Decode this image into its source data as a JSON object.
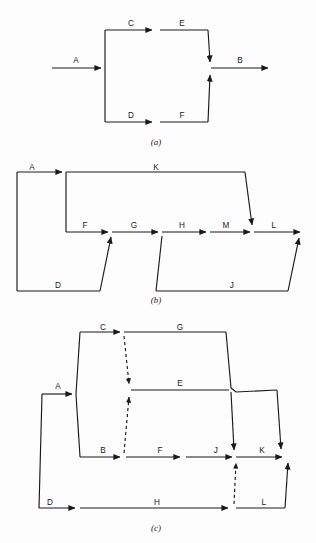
{
  "figure": {
    "background_color": "#fdfdfd",
    "line_color": "#1a1a1a",
    "width": 316,
    "height": 543
  },
  "diagrams": [
    {
      "id": "a",
      "caption": "(a)",
      "caption_x": 156,
      "caption_y": 145,
      "description": "Simple parallel network: activity A splits into parallel paths C-E and D-F which merge into B",
      "activities": [
        {
          "label": "A",
          "x": 76,
          "y": 63
        },
        {
          "label": "C",
          "x": 131,
          "y": 26
        },
        {
          "label": "E",
          "x": 182,
          "y": 26
        },
        {
          "label": "D",
          "x": 131,
          "y": 118
        },
        {
          "label": "F",
          "x": 182,
          "y": 118
        },
        {
          "label": "B",
          "x": 240,
          "y": 63
        }
      ]
    },
    {
      "id": "b",
      "caption": "(b)",
      "caption_x": 156,
      "caption_y": 303,
      "description": "Network with long bypass activity K over chain F-G-H-M, plus feeder activities D and J merging in",
      "activities": [
        {
          "label": "A",
          "x": 32,
          "y": 170
        },
        {
          "label": "K",
          "x": 156,
          "y": 170
        },
        {
          "label": "F",
          "x": 85,
          "y": 228
        },
        {
          "label": "G",
          "x": 134,
          "y": 228
        },
        {
          "label": "H",
          "x": 182,
          "y": 228
        },
        {
          "label": "M",
          "x": 226,
          "y": 228
        },
        {
          "label": "L",
          "x": 274,
          "y": 228
        },
        {
          "label": "D",
          "x": 58,
          "y": 288
        },
        {
          "label": "J",
          "x": 232,
          "y": 288
        }
      ]
    },
    {
      "id": "c",
      "caption": "(c)",
      "caption_x": 156,
      "caption_y": 531,
      "description": "Three-tier network with dummy (dashed) activities linking the C/G tier, E tier, B-F-J tier and the bottom D-H-L tier",
      "activities": [
        {
          "label": "A",
          "x": 58,
          "y": 389
        },
        {
          "label": "C",
          "x": 103,
          "y": 330
        },
        {
          "label": "G",
          "x": 180,
          "y": 330
        },
        {
          "label": "E",
          "x": 180,
          "y": 386
        },
        {
          "label": "B",
          "x": 103,
          "y": 447
        },
        {
          "label": "F",
          "x": 160,
          "y": 447
        },
        {
          "label": "J",
          "x": 216,
          "y": 447
        },
        {
          "label": "K",
          "x": 262,
          "y": 447
        },
        {
          "label": "D",
          "x": 50,
          "y": 508
        },
        {
          "label": "H",
          "x": 157,
          "y": 508
        },
        {
          "label": "L",
          "x": 264,
          "y": 508
        }
      ],
      "dummy_activities": 3
    }
  ]
}
